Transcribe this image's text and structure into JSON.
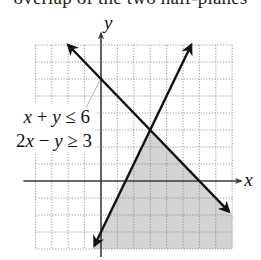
{
  "caption": "overlap of the two half-planes",
  "chart_data": {
    "type": "line",
    "title": "",
    "xlabel": "x",
    "ylabel": "y",
    "xlim": [
      -4,
      8
    ],
    "ylim": [
      -4,
      8
    ],
    "grid": true,
    "grid_step": 1,
    "series": [
      {
        "name": "x + y ≤ 6",
        "equation": "x + y = 6",
        "points": [
          [
            -2,
            8
          ],
          [
            7.8,
            -1.8
          ]
        ],
        "arrows": "both"
      },
      {
        "name": "2x − y ≥ 3",
        "equation": "2x - y = 3",
        "points": [
          [
            5.5,
            8
          ],
          [
            -0.4,
            -3.8
          ]
        ],
        "arrows": "both"
      }
    ],
    "shaded_region": {
      "description": "solution set of x + y ≤ 6 and 2x − y ≥ 3",
      "vertices": [
        [
          3,
          3
        ],
        [
          8,
          -2
        ],
        [
          8,
          -4
        ],
        [
          -0.5,
          -4
        ]
      ],
      "color": "#d3d3d3"
    },
    "intersection": [
      3,
      3
    ],
    "annotations": [
      {
        "text": "x + y ≤ 6",
        "parts": [
          [
            "x",
            true
          ],
          [
            " + ",
            false
          ],
          [
            "y",
            true
          ],
          [
            " ≤ 6",
            false
          ]
        ]
      },
      {
        "text": "2x − y ≥ 3",
        "parts": [
          [
            "2",
            false
          ],
          [
            "x",
            true
          ],
          [
            " − ",
            false
          ],
          [
            "y",
            true
          ],
          [
            " ≥ 3",
            false
          ]
        ]
      }
    ]
  },
  "layout": {
    "origin_px": [
      101,
      181
    ],
    "unit_px": [
      16.4,
      17
    ],
    "colors": {
      "shade": "#d3d3d3",
      "line": "#111111",
      "axis": "#3a3a3a",
      "grid": "#8c8c8c",
      "background": "#ffffff"
    }
  }
}
